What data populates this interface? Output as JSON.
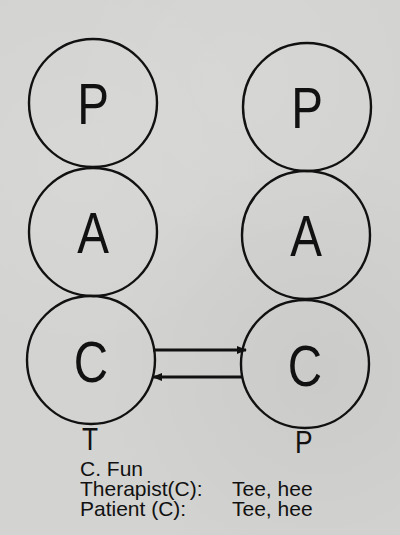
{
  "diagram": {
    "type": "transactional-analysis-ego-state-diagram",
    "left_person": {
      "label": "T",
      "states": [
        {
          "letter": "P",
          "cx": 93,
          "cy": 103
        },
        {
          "letter": "A",
          "cx": 93,
          "cy": 232
        },
        {
          "letter": "C",
          "cx": 91,
          "cy": 360
        }
      ]
    },
    "right_person": {
      "label": "P",
      "states": [
        {
          "letter": "P",
          "cx": 307,
          "cy": 107
        },
        {
          "letter": "A",
          "cx": 306,
          "cy": 235
        },
        {
          "letter": "C",
          "cx": 305,
          "cy": 364
        }
      ]
    },
    "circle_radius": 64,
    "transactions": [
      {
        "from": "left C",
        "to": "right C",
        "direction": "right"
      },
      {
        "from": "right C",
        "to": "left C",
        "direction": "left"
      }
    ],
    "line_color": "#111111",
    "background_color": "#d3d3d1"
  },
  "caption": {
    "title": "C. Fun",
    "lines": [
      {
        "speaker": "Therapist(C):",
        "remark": "Tee, hee"
      },
      {
        "speaker": "Patient (C):",
        "remark": "Tee, hee"
      }
    ]
  }
}
